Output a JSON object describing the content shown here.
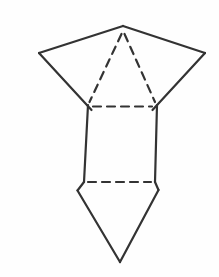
{
  "figure": {
    "background_color": "#fefefe",
    "stroke_color": "#333333",
    "stroke_width": 2.2,
    "dash_pattern": "8 6",
    "canvas": {
      "width": 219,
      "height": 277
    },
    "points": {
      "top_apex": [
        123,
        26
      ],
      "left_outer": [
        39,
        53
      ],
      "right_outer": [
        205,
        53
      ],
      "rect_top_left": [
        88,
        105
      ],
      "rect_top_right": [
        157,
        105
      ],
      "rect_bottom_left": [
        84,
        182
      ],
      "rect_bottom_right": [
        155,
        182
      ],
      "bottom_left_flare": [
        77.5,
        190.5
      ],
      "bottom_right_flare": [
        158.5,
        190
      ],
      "bottom_apex": [
        120,
        262
      ]
    },
    "edges": [
      {
        "name": "edge-top-left-slant",
        "from": [
          39,
          53
        ],
        "to": [
          123,
          26
        ],
        "style": "solid"
      },
      {
        "name": "edge-top-right-slant",
        "from": [
          123,
          26
        ],
        "to": [
          205,
          53
        ],
        "style": "solid"
      },
      {
        "name": "edge-left-lower-slant",
        "from": [
          39,
          53
        ],
        "to": [
          91.5,
          110
        ],
        "style": "solid"
      },
      {
        "name": "edge-right-lower-slant",
        "from": [
          205,
          53
        ],
        "to": [
          152.5,
          110
        ],
        "style": "solid"
      },
      {
        "name": "edge-left-vertical",
        "from": [
          88,
          105
        ],
        "to": [
          84,
          182
        ],
        "style": "solid"
      },
      {
        "name": "edge-right-vertical",
        "from": [
          157,
          105
        ],
        "to": [
          155,
          182
        ],
        "style": "solid"
      },
      {
        "name": "edge-bottom-left-flare",
        "from": [
          84,
          182
        ],
        "to": [
          77.5,
          190.5
        ],
        "style": "solid"
      },
      {
        "name": "edge-bottom-left-slant",
        "from": [
          77.5,
          190.5
        ],
        "to": [
          120,
          262
        ],
        "style": "solid"
      },
      {
        "name": "edge-bottom-right-flare",
        "from": [
          155,
          182
        ],
        "to": [
          158.5,
          190
        ],
        "style": "solid"
      },
      {
        "name": "edge-bottom-right-slant",
        "from": [
          158.5,
          190
        ],
        "to": [
          120,
          262
        ],
        "style": "solid"
      },
      {
        "name": "edge-hidden-left-diagonal",
        "from": [
          121.5,
          34
        ],
        "to": [
          89.5,
          102
        ],
        "style": "dashed"
      },
      {
        "name": "edge-hidden-right-diagonal",
        "from": [
          124.5,
          34
        ],
        "to": [
          155,
          102
        ],
        "style": "dashed"
      },
      {
        "name": "edge-hidden-top-horizontal",
        "from": [
          93,
          106.5
        ],
        "to": [
          152,
          106.5
        ],
        "style": "dashed"
      },
      {
        "name": "edge-hidden-bottom-horizontal",
        "from": [
          88,
          182
        ],
        "to": [
          151,
          182
        ],
        "style": "dashed"
      }
    ]
  }
}
